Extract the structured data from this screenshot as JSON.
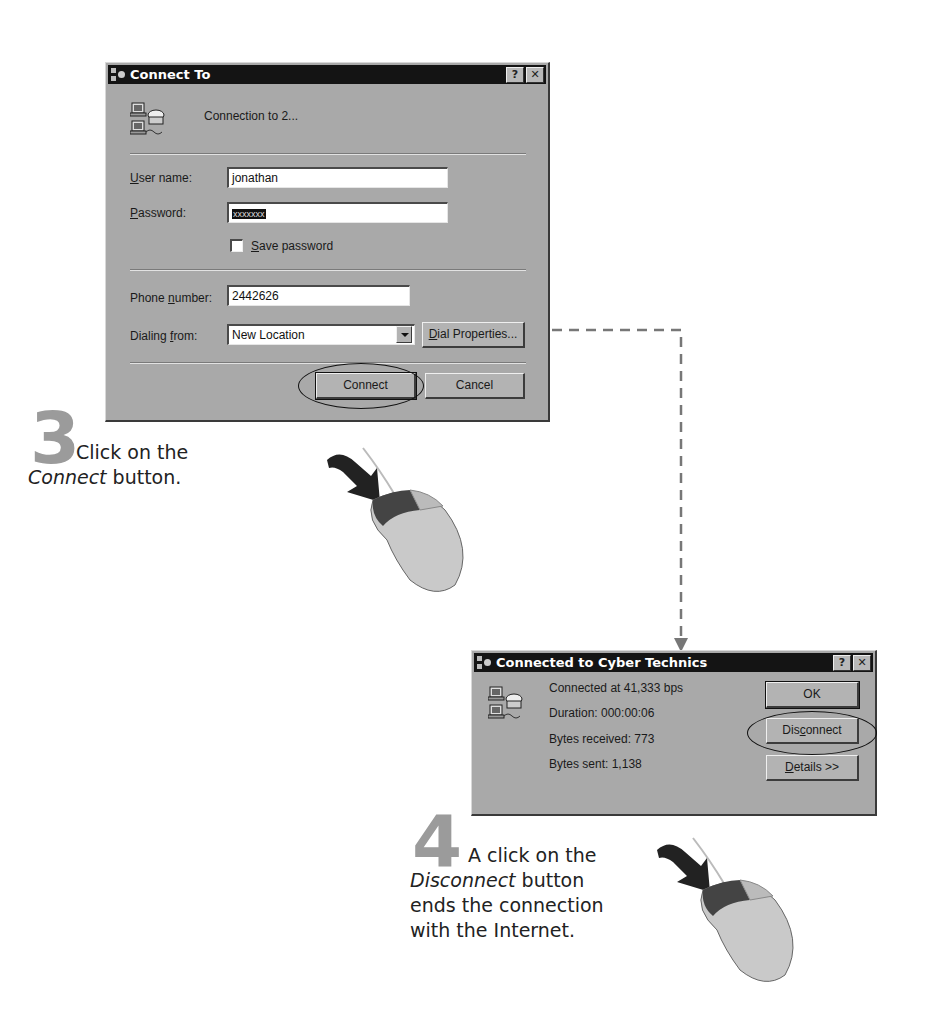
{
  "connect_dialog": {
    "title": "Connect To",
    "title_buttons": {
      "help": "?",
      "close": "✕"
    },
    "connection_name": "Connection to 2...",
    "user_name": {
      "label_prefix": "",
      "label_accel": "U",
      "label_rest": "ser name:",
      "value": "jonathan"
    },
    "password": {
      "label_accel": "P",
      "label_rest": "assword:",
      "value": "xxxxxxx"
    },
    "save_password": {
      "label_accel": "S",
      "label_rest": "ave password",
      "checked": false
    },
    "phone_number": {
      "label_pre": "Phone ",
      "label_accel": "n",
      "label_rest": "umber:",
      "value": "2442626"
    },
    "dialing_from": {
      "label_pre": "Dialing ",
      "label_accel": "f",
      "label_rest": "rom:",
      "value": "New Location"
    },
    "dial_properties": {
      "accel": "D",
      "rest": "ial Properties..."
    },
    "connect_button": "Connect",
    "cancel_button": "Cancel"
  },
  "connected_dialog": {
    "title": "Connected to Cyber Technics",
    "title_buttons": {
      "help": "?",
      "close": "✕"
    },
    "status_lines": [
      "Connected at 41,333 bps",
      "Duration:  000:00:06",
      "Bytes received:  773",
      "Bytes sent:  1,138"
    ],
    "ok_button": "OK",
    "disconnect_button": {
      "pre": "Dis",
      "accel": "c",
      "rest": "onnect"
    },
    "details_button": {
      "accel": "D",
      "rest": "etails >>"
    }
  },
  "steps": [
    {
      "number": "3",
      "text_plain_1": "Click on the",
      "text_italic": "Connect",
      "text_plain_2": " button."
    },
    {
      "number": "4",
      "text_plain_1": "A click on the",
      "text_italic": "Disconnect",
      "text_plain_2": " button",
      "text_line3": "ends the connection",
      "text_line4": "with the Internet."
    }
  ],
  "colors": {
    "dialog_bg": "#a9a9a9",
    "titlebar": "#141414",
    "step_number": "#9b9b9b",
    "connector": "#777777"
  }
}
